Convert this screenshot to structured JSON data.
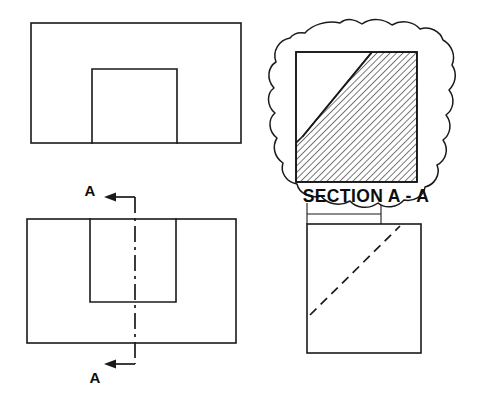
{
  "drawing": {
    "title": "Orthographic drawing with full section view",
    "line_color": "#1a1a1a",
    "background_color": "#ffffff",
    "views": {
      "top_view": {
        "name": "top view",
        "outer_rect": {
          "x": 31,
          "y": 23,
          "width": 210,
          "height": 120
        },
        "inner_rect": {
          "x": 92,
          "y": 69,
          "width": 85,
          "height": 74
        }
      },
      "front_view": {
        "name": "front view",
        "outer_rect": {
          "x": 27,
          "y": 219,
          "width": 209,
          "height": 124
        },
        "inner_rect": {
          "x": 90,
          "y": 219,
          "width": 86,
          "height": 83
        }
      },
      "side_view": {
        "name": "right side view",
        "outer_rect": {
          "x": 307,
          "y": 224,
          "width": 114,
          "height": 129
        },
        "hidden_diagonal": {
          "x1": 310,
          "y1": 315,
          "x2": 400,
          "y2": 226
        }
      },
      "section_view": {
        "name": "section A-A detail",
        "square": {
          "x": 296,
          "y": 52,
          "width": 121,
          "height": 130
        },
        "diagonal": {
          "x1": 303,
          "y1": 136,
          "x2": 372,
          "y2": 52
        },
        "hatch_angle_degrees": 45,
        "hatch_spacing_px": 4.6
      }
    },
    "cutting_plane": {
      "name": "cutting plane A-A",
      "line_x": 135,
      "top_y": 197,
      "bottom_y": 364,
      "arrow_direction": "left"
    }
  },
  "labels": {
    "cut_mark_top": "A",
    "cut_mark_bottom": "A",
    "section_title": "SECTION A - A"
  }
}
